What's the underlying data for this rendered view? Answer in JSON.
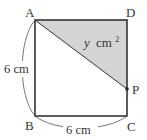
{
  "diagram": {
    "type": "geometry",
    "shape": "square ABCD with moving point P on side DC",
    "vertices": {
      "A": {
        "label": "A",
        "x": 35,
        "y": 20
      },
      "B": {
        "label": "B",
        "x": 35,
        "y": 116
      },
      "C": {
        "label": "C",
        "x": 127,
        "y": 116
      },
      "D": {
        "label": "D",
        "x": 127,
        "y": 20
      },
      "P": {
        "label": "P",
        "x": 127,
        "y": 89
      }
    },
    "shaded_region": {
      "vertices": [
        "A",
        "D",
        "P"
      ],
      "label_var": "y",
      "label_unit": "cm",
      "label_exp": "2",
      "fill": "#d4d4d4"
    },
    "dimensions": {
      "left": "6 cm",
      "bottom": "6 cm"
    },
    "colors": {
      "stroke": "#333333",
      "shade": "#d4d4d4",
      "text": "#333333"
    }
  }
}
